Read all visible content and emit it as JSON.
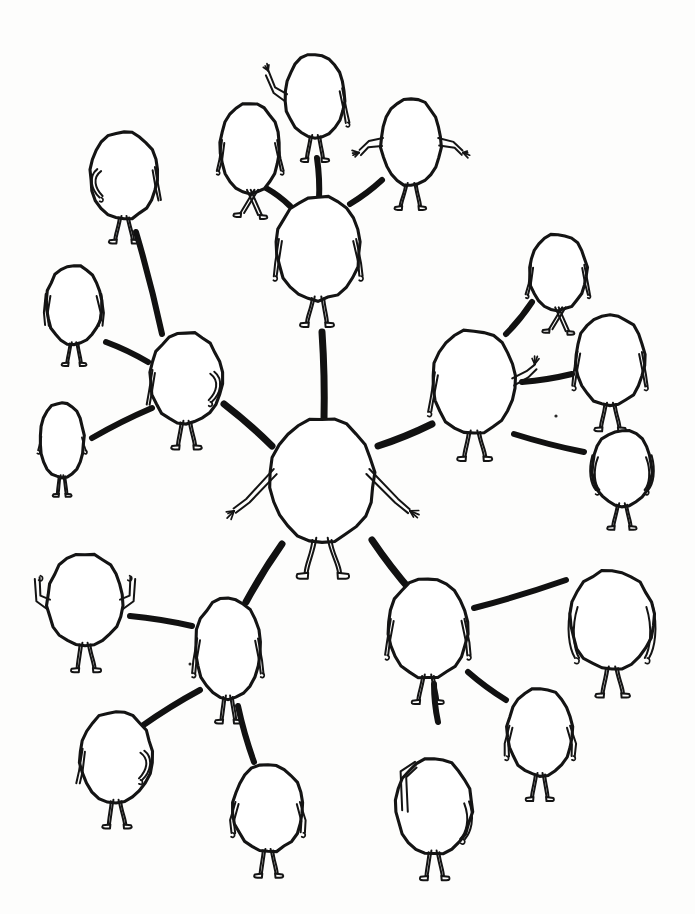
{
  "artwork": {
    "title": "Hand-drawn network of blob figures",
    "medium": "ink-on-paper-scan",
    "background_color": "#fdfdfc",
    "ink_color": "#141414",
    "edge_color": "#111111",
    "canvas": {
      "width": 695,
      "height": 914
    }
  },
  "diagram": {
    "type": "hub-and-spoke-network",
    "hub_id": "center",
    "node_count": 21,
    "edge_count": 20
  },
  "nodes": [
    {
      "id": "center",
      "label": "center-hub-figure",
      "x": 322,
      "y": 480,
      "rx": 52,
      "ry": 62,
      "pose": "arms-out-hands-spread",
      "scale": 1.0
    },
    {
      "id": "n-top",
      "label": "top-center-figure",
      "x": 318,
      "y": 248,
      "rx": 42,
      "ry": 52,
      "pose": "arms-down-walking",
      "scale": 0.85
    },
    {
      "id": "n-topleft",
      "label": "upper-left-figure",
      "x": 186,
      "y": 378,
      "rx": 36,
      "ry": 46,
      "pose": "arm-bent-back",
      "scale": 0.8
    },
    {
      "id": "n-topright",
      "label": "upper-right-figure",
      "x": 474,
      "y": 382,
      "rx": 42,
      "ry": 52,
      "pose": "waving-right-hand",
      "scale": 0.85
    },
    {
      "id": "n-botleft",
      "label": "lower-left-figure",
      "x": 228,
      "y": 648,
      "rx": 33,
      "ry": 51,
      "pose": "arms-at-sides-narrow",
      "scale": 0.78
    },
    {
      "id": "n-botright",
      "label": "lower-right-figure",
      "x": 428,
      "y": 628,
      "rx": 40,
      "ry": 50,
      "pose": "arms-hanging",
      "scale": 0.82
    },
    {
      "id": "l-far",
      "label": "far-left-small-figure",
      "x": 62,
      "y": 440,
      "rx": 22,
      "ry": 38,
      "pose": "tiny-arms-down",
      "scale": 0.54
    },
    {
      "id": "l-mid",
      "label": "left-mid-figure",
      "x": 74,
      "y": 305,
      "rx": 28,
      "ry": 40,
      "pose": "arms-splayed",
      "scale": 0.66
    },
    {
      "id": "l-up",
      "label": "left-upper-figure",
      "x": 124,
      "y": 175,
      "rx": 34,
      "ry": 44,
      "pose": "arm-on-hip",
      "scale": 0.76
    },
    {
      "id": "t-left",
      "label": "top-left-walker",
      "x": 250,
      "y": 148,
      "rx": 30,
      "ry": 45,
      "pose": "striding",
      "scale": 0.74
    },
    {
      "id": "t-wave",
      "label": "top-waving-figure",
      "x": 315,
      "y": 96,
      "rx": 30,
      "ry": 42,
      "pose": "hand-raised-waving",
      "scale": 0.74
    },
    {
      "id": "t-right",
      "label": "top-right-figure",
      "x": 411,
      "y": 142,
      "rx": 30,
      "ry": 44,
      "pose": "arms-out-fingers",
      "scale": 0.74
    },
    {
      "id": "r-up",
      "label": "right-upper-figure",
      "x": 558,
      "y": 272,
      "rx": 29,
      "ry": 38,
      "pose": "legs-crossed-walking",
      "scale": 0.7
    },
    {
      "id": "r-mid",
      "label": "right-mid-figure",
      "x": 610,
      "y": 360,
      "rx": 35,
      "ry": 46,
      "pose": "arms-down-thin",
      "scale": 0.78
    },
    {
      "id": "r-low",
      "label": "right-lower-figure",
      "x": 622,
      "y": 468,
      "rx": 30,
      "ry": 38,
      "pose": "arms-curled",
      "scale": 0.72
    },
    {
      "id": "b-flex",
      "label": "bottom-left-flexing",
      "x": 85,
      "y": 600,
      "rx": 38,
      "ry": 46,
      "pose": "both-arms-flexed-up",
      "scale": 0.8
    },
    {
      "id": "b-left",
      "label": "bottom-left-figure",
      "x": 116,
      "y": 757,
      "rx": 36,
      "ry": 46,
      "pose": "arm-folded-front",
      "scale": 0.78
    },
    {
      "id": "b-center",
      "label": "bottom-center-figure",
      "x": 268,
      "y": 808,
      "rx": 35,
      "ry": 44,
      "pose": "arms-down-short",
      "scale": 0.78
    },
    {
      "id": "b-right",
      "label": "bottom-right-figure",
      "x": 434,
      "y": 806,
      "rx": 38,
      "ry": 48,
      "pose": "hand-behind-head",
      "scale": 0.8
    },
    {
      "id": "br-mid",
      "label": "bottom-right-mid-figure",
      "x": 540,
      "y": 732,
      "rx": 33,
      "ry": 44,
      "pose": "arms-bent-down",
      "scale": 0.76
    },
    {
      "id": "br-far",
      "label": "bottom-right-far-figure",
      "x": 612,
      "y": 620,
      "rx": 42,
      "ry": 50,
      "pose": "long-curved-arms",
      "scale": 0.84
    }
  ],
  "edges": [
    {
      "id": "e-center-top",
      "from": "center",
      "to": "n-top",
      "x1": 324,
      "y1": 420,
      "x2": 322,
      "y2": 332,
      "width": 7
    },
    {
      "id": "e-center-topleft",
      "from": "center",
      "to": "n-topleft",
      "x1": 272,
      "y1": 446,
      "x2": 224,
      "y2": 404,
      "width": 7
    },
    {
      "id": "e-center-topright",
      "from": "center",
      "to": "n-topright",
      "x1": 378,
      "y1": 446,
      "x2": 432,
      "y2": 424,
      "width": 7
    },
    {
      "id": "e-center-botleft",
      "from": "center",
      "to": "n-botleft",
      "x1": 282,
      "y1": 544,
      "x2": 246,
      "y2": 602,
      "width": 7
    },
    {
      "id": "e-center-botright",
      "from": "center",
      "to": "n-botright",
      "x1": 372,
      "y1": 540,
      "x2": 412,
      "y2": 592,
      "width": 7
    },
    {
      "id": "e-top-tleft",
      "from": "n-top",
      "to": "t-left",
      "x1": 290,
      "y1": 206,
      "x2": 266,
      "y2": 188,
      "width": 6
    },
    {
      "id": "e-top-twave",
      "from": "n-top",
      "to": "t-wave",
      "x1": 319,
      "y1": 200,
      "x2": 317,
      "y2": 158,
      "width": 6
    },
    {
      "id": "e-top-tright",
      "from": "n-top",
      "to": "t-right",
      "x1": 350,
      "y1": 204,
      "x2": 382,
      "y2": 180,
      "width": 6
    },
    {
      "id": "e-topleft-lup",
      "from": "n-topleft",
      "to": "l-up",
      "x1": 162,
      "y1": 334,
      "x2": 136,
      "y2": 232,
      "width": 6
    },
    {
      "id": "e-topleft-lmid",
      "from": "n-topleft",
      "to": "l-mid",
      "x1": 148,
      "y1": 362,
      "x2": 106,
      "y2": 342,
      "width": 6
    },
    {
      "id": "e-topleft-lfar",
      "from": "n-topleft",
      "to": "l-far",
      "x1": 152,
      "y1": 408,
      "x2": 92,
      "y2": 438,
      "width": 6
    },
    {
      "id": "e-topright-rup",
      "from": "n-topright",
      "to": "r-up",
      "x1": 506,
      "y1": 334,
      "x2": 532,
      "y2": 302,
      "width": 6
    },
    {
      "id": "e-topright-rmid",
      "from": "n-topright",
      "to": "r-mid",
      "x1": 522,
      "y1": 382,
      "x2": 572,
      "y2": 374,
      "width": 6
    },
    {
      "id": "e-topright-rlow",
      "from": "n-topright",
      "to": "r-low",
      "x1": 514,
      "y1": 434,
      "x2": 584,
      "y2": 452,
      "width": 6
    },
    {
      "id": "e-botleft-bflex",
      "from": "n-botleft",
      "to": "b-flex",
      "x1": 192,
      "y1": 626,
      "x2": 130,
      "y2": 616,
      "width": 6
    },
    {
      "id": "e-botleft-bleft",
      "from": "n-botleft",
      "to": "b-left",
      "x1": 200,
      "y1": 690,
      "x2": 142,
      "y2": 726,
      "width": 6
    },
    {
      "id": "e-botleft-bcenter",
      "from": "n-botleft",
      "to": "b-center",
      "x1": 238,
      "y1": 706,
      "x2": 254,
      "y2": 762,
      "width": 6
    },
    {
      "id": "e-botright-bright",
      "from": "n-botright",
      "to": "b-right",
      "x1": 434,
      "y1": 684,
      "x2": 438,
      "y2": 722,
      "width": 6
    },
    {
      "id": "e-botright-brmid",
      "from": "n-botright",
      "to": "br-mid",
      "x1": 468,
      "y1": 672,
      "x2": 506,
      "y2": 700,
      "width": 6
    },
    {
      "id": "e-botright-brfar",
      "from": "n-botright",
      "to": "br-far",
      "x1": 474,
      "y1": 608,
      "x2": 566,
      "y2": 580,
      "width": 6
    }
  ],
  "specks": [
    {
      "id": "speck-1",
      "x": 556,
      "y": 416,
      "r": 1.6
    },
    {
      "id": "speck-2",
      "x": 190,
      "y": 664,
      "r": 1.5
    }
  ]
}
